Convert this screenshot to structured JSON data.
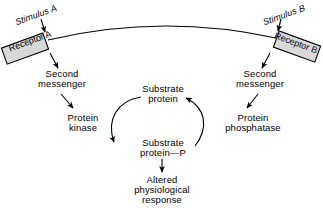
{
  "diagram": {
    "background_color": "#ffffff",
    "stroke_color": "#000000",
    "receptor_fill_color": "#d8d8d8",
    "membrane": {
      "name": "cell-membrane-arc",
      "description": "curved line connecting Receptor A and Receptor B"
    },
    "left_branch": {
      "stimulus": "Stimulus A",
      "receptor": "Receptor A",
      "second_messenger_line1": "Second",
      "second_messenger_line2": "messenger",
      "effector_line1": "Protein",
      "effector_line2": "kinase"
    },
    "right_branch": {
      "stimulus": "Stimulus B",
      "receptor": "Receptor B",
      "second_messenger_line1": "Second",
      "second_messenger_line2": "messenger",
      "effector_line1": "Protein",
      "effector_line2": "phosphatase"
    },
    "center": {
      "substrate_line1": "Substrate",
      "substrate_line2": "protein",
      "phospho_substrate_line1": "Substrate",
      "phospho_substrate_line2": "protein—P",
      "outcome_line1": "Altered",
      "outcome_line2": "physiological",
      "outcome_line3": "response"
    }
  }
}
